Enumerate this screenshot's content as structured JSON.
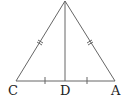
{
  "diagram": {
    "type": "isosceles-triangle-with-median",
    "vertices": {
      "apex": {
        "label": "",
        "x": 65,
        "y": 1
      },
      "C": {
        "label": "C",
        "x": 16,
        "y": 81
      },
      "A": {
        "label": "A",
        "x": 115,
        "y": 81
      },
      "D": {
        "label": "D",
        "x": 65,
        "y": 81
      }
    },
    "labels": {
      "C": "C",
      "D": "D",
      "A": "A"
    },
    "markings": {
      "equal_sides": "double tick on left and right sides",
      "equal_base_halves": "single tick on CD and DA"
    },
    "stroke_color": "#555555",
    "label_color": "#222222"
  }
}
